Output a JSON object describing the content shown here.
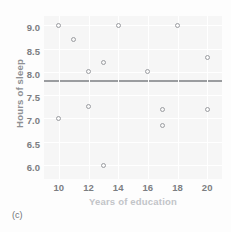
{
  "caption": "(c)",
  "colors": {
    "panel_background": "#f6f6f6",
    "gridline": "#ffffff",
    "marker": "#9b9da1",
    "fit_line": "#9a9c9f",
    "tick_label": "#7c7e82",
    "ylabel": "#8e9094",
    "xlabel": "#c2c4c8"
  },
  "chart_data": {
    "type": "scatter",
    "title": "",
    "xlabel": "Years of education",
    "ylabel": "Hours of sleep",
    "xlim": [
      9,
      21
    ],
    "ylim": [
      5.7,
      9.2
    ],
    "xticks": [
      10,
      12,
      14,
      16,
      18,
      20
    ],
    "yticks": [
      6.0,
      6.5,
      7.0,
      7.5,
      8.0,
      8.5,
      9.0
    ],
    "xtick_labels": [
      "10",
      "12",
      "14",
      "16",
      "18",
      "20"
    ],
    "ytick_labels": [
      "6.0",
      "6.5",
      "7.0",
      "7.5",
      "8.0",
      "8.5",
      "9.0"
    ],
    "grid": true,
    "legend": "none",
    "points": [
      {
        "x": 10,
        "y": 9.0
      },
      {
        "x": 14,
        "y": 9.0
      },
      {
        "x": 18,
        "y": 9.0
      },
      {
        "x": 11,
        "y": 8.7
      },
      {
        "x": 20,
        "y": 8.3
      },
      {
        "x": 13,
        "y": 8.2
      },
      {
        "x": 12,
        "y": 8.0
      },
      {
        "x": 16,
        "y": 8.0
      },
      {
        "x": 12,
        "y": 7.25
      },
      {
        "x": 17,
        "y": 7.2
      },
      {
        "x": 20,
        "y": 7.2
      },
      {
        "x": 10,
        "y": 7.0
      },
      {
        "x": 17,
        "y": 6.85
      },
      {
        "x": 13,
        "y": 6.0
      }
    ],
    "annotations": [
      {
        "type": "horizontal-line",
        "y": 7.8,
        "label": "fit line"
      }
    ]
  }
}
